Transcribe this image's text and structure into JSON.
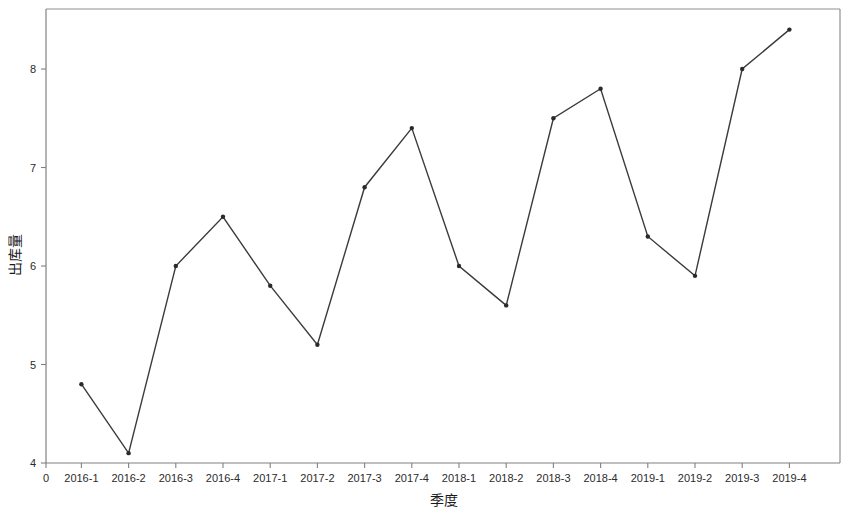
{
  "chart_data": {
    "type": "line",
    "title": "",
    "xlabel": "季度",
    "ylabel": "出库量",
    "categories": [
      "2016-1",
      "2016-2",
      "2016-3",
      "2016-4",
      "2017-1",
      "2017-2",
      "2017-3",
      "2017-4",
      "2018-1",
      "2018-2",
      "2018-3",
      "2018-4",
      "2019-1",
      "2019-2",
      "2019-3",
      "2019-4"
    ],
    "values": [
      4.8,
      4.1,
      6.0,
      6.5,
      5.8,
      5.2,
      6.8,
      7.4,
      6.0,
      5.6,
      7.5,
      7.8,
      6.3,
      5.9,
      8.0,
      8.4
    ],
    "series": [
      {
        "name": "出库量",
        "values": [
          4.8,
          4.1,
          6.0,
          6.5,
          5.8,
          5.2,
          6.8,
          7.4,
          6.0,
          5.6,
          7.5,
          7.8,
          6.3,
          5.9,
          8.0,
          8.4
        ]
      }
    ],
    "y_ticks": [
      4,
      5,
      6,
      7,
      8
    ],
    "y_tick_labels": [
      "4",
      "5",
      "6",
      "7",
      "8"
    ],
    "ylim": [
      3.8,
      8.6
    ],
    "x_origin_label": "0",
    "grid": false,
    "legend": "none",
    "line_color": "#3b3b3b",
    "marker_color": "#2a2a2a",
    "axis_color": "#808080",
    "background_color": "#ffffff",
    "marker_style": "dot",
    "marker_size": 2.2
  }
}
